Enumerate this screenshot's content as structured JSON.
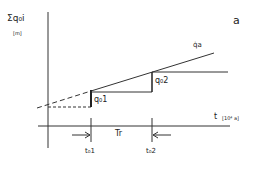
{
  "diagram": {
    "corner_label": "a",
    "y_axis": {
      "label": "Σq₀i",
      "unit": "[m]"
    },
    "x_axis": {
      "label": "t",
      "unit": "[10⁴ a]"
    },
    "curve_label": "q̇a",
    "step_labels": [
      "q₀1",
      "q₀2"
    ],
    "interval_label": "Tr",
    "time_marks": [
      "t₀1",
      "t₀2"
    ],
    "colors": {
      "line": "#222222",
      "background": "#ffffff"
    }
  }
}
